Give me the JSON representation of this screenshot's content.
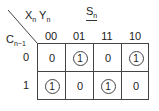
{
  "kmap": {
    "title": "S",
    "title_sub": "n",
    "column_var_1": "X",
    "column_var_1_sub": "n",
    "column_var_2": "Y",
    "column_var_2_sub": "n",
    "row_var": "C",
    "row_var_sub": "n−1",
    "columns": [
      "00",
      "01",
      "11",
      "10"
    ],
    "rows": [
      "0",
      "1"
    ],
    "cells": [
      [
        {
          "value": "0",
          "circled": false
        },
        {
          "value": "1",
          "circled": true
        },
        {
          "value": "0",
          "circled": false
        },
        {
          "value": "1",
          "circled": true
        }
      ],
      [
        {
          "value": "1",
          "circled": true
        },
        {
          "value": "0",
          "circled": false
        },
        {
          "value": "1",
          "circled": true
        },
        {
          "value": "0",
          "circled": false
        }
      ]
    ]
  }
}
